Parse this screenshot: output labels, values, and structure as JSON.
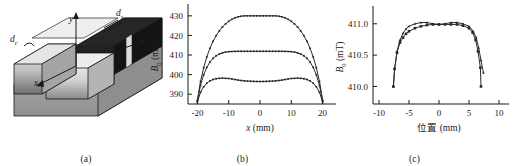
{
  "figure": {
    "panels": [
      {
        "id": "a",
        "caption": "(a)"
      },
      {
        "id": "b",
        "caption": "(b)"
      },
      {
        "id": "c",
        "caption": "(c)"
      }
    ]
  },
  "diagram": {
    "caption": "(a)",
    "labels": {
      "axis_x": "x",
      "axis_y": "y",
      "axis_z": "z",
      "dim_c_base": "d",
      "dim_c_sub": "c",
      "dim_s_base": "d",
      "dim_s_sub": "s"
    },
    "colors": {
      "slab_top": "#e9e9e9",
      "slab_front": "#bdbdbd",
      "slab_side": "#9a9a9a",
      "dark_block": "#2a2a2a",
      "base": "#a8a8a8",
      "outline": "#1a1a1a"
    }
  },
  "chart_data": [
    {
      "panel": "b",
      "type": "line",
      "title": "",
      "xlabel": "x (mm)",
      "ylabel": "B0 (mT)",
      "ylabel_base": "B",
      "ylabel_sub": "0",
      "ylabel_unit": "(mT)",
      "xlim": [
        -23,
        23
      ],
      "ylim": [
        385,
        434
      ],
      "xticks": [
        -20,
        -10,
        0,
        10,
        20
      ],
      "xticklabels": [
        "-20",
        "-10",
        "0",
        "10",
        "20"
      ],
      "yticks": [
        390,
        400,
        410,
        420,
        430
      ],
      "yticklabels": [
        "390",
        "400",
        "410",
        "420",
        "430"
      ],
      "grid": false,
      "legend": "none",
      "markers": "small filled squares along each curve",
      "series": [
        {
          "name": "curve-top",
          "x": [
            -20,
            -19,
            -18,
            -17,
            -16,
            -15,
            -14,
            -13,
            -12,
            -11,
            -10,
            -9,
            -8,
            -7,
            -6,
            -5,
            -4,
            -3,
            -2,
            -1,
            0,
            1,
            2,
            3,
            4,
            5,
            6,
            7,
            8,
            9,
            10,
            11,
            12,
            13,
            14,
            15,
            16,
            17,
            18,
            19,
            20
          ],
          "y": [
            387.0,
            396.5,
            403.5,
            409.0,
            413.4,
            417.0,
            419.9,
            422.3,
            424.3,
            425.9,
            427.2,
            428.2,
            429.0,
            429.5,
            429.8,
            430.0,
            430.0,
            430.0,
            430.0,
            430.0,
            430.0,
            430.0,
            430.0,
            430.0,
            430.0,
            430.0,
            429.8,
            429.5,
            429.0,
            428.2,
            427.2,
            425.9,
            424.3,
            422.3,
            419.9,
            417.0,
            413.4,
            409.0,
            403.5,
            396.5,
            387.0
          ]
        },
        {
          "name": "curve-middle",
          "x": [
            -20,
            -19,
            -18,
            -17,
            -16,
            -15,
            -14,
            -13,
            -12,
            -11,
            -10,
            -9,
            -8,
            -7,
            -6,
            -5,
            -4,
            -3,
            -2,
            -1,
            0,
            1,
            2,
            3,
            4,
            5,
            6,
            7,
            8,
            9,
            10,
            11,
            12,
            13,
            14,
            15,
            16,
            17,
            18,
            19,
            20
          ],
          "y": [
            386.5,
            394.5,
            399.9,
            403.7,
            406.4,
            408.3,
            409.6,
            410.5,
            411.1,
            411.5,
            411.7,
            411.8,
            411.85,
            411.9,
            411.9,
            411.9,
            411.9,
            411.9,
            411.9,
            411.9,
            411.9,
            411.9,
            411.9,
            411.9,
            411.9,
            411.9,
            411.9,
            411.9,
            411.85,
            411.8,
            411.7,
            411.5,
            411.1,
            410.5,
            409.6,
            408.3,
            406.4,
            403.7,
            399.9,
            394.5,
            386.5
          ]
        },
        {
          "name": "curve-bottom",
          "x": [
            -20,
            -19,
            -18,
            -17,
            -16,
            -15,
            -14,
            -13,
            -12,
            -11,
            -10,
            -9,
            -8,
            -7,
            -6,
            -5,
            -4,
            -3,
            -2,
            -1,
            0,
            1,
            2,
            3,
            4,
            5,
            6,
            7,
            8,
            9,
            10,
            11,
            12,
            13,
            14,
            15,
            16,
            17,
            18,
            19,
            20
          ],
          "y": [
            386.0,
            391.0,
            393.8,
            395.6,
            396.8,
            397.5,
            397.9,
            398.1,
            398.2,
            398.1,
            398.0,
            397.8,
            397.5,
            397.2,
            397.0,
            396.8,
            396.7,
            396.6,
            396.55,
            396.5,
            396.5,
            396.5,
            396.55,
            396.6,
            396.7,
            396.8,
            397.0,
            397.2,
            397.5,
            397.8,
            398.0,
            398.1,
            398.2,
            398.1,
            397.9,
            397.5,
            396.8,
            395.6,
            393.8,
            391.0,
            386.0
          ]
        }
      ]
    },
    {
      "panel": "c",
      "type": "line",
      "title": "",
      "xlabel": "位置 (mm)",
      "xlabel_cn": "位置",
      "xlabel_unit": "(mm)",
      "ylabel": "B0 (mT)",
      "ylabel_base": "B",
      "ylabel_sub": "0",
      "ylabel_unit": "(mT)",
      "xlim": [
        -11,
        11
      ],
      "ylim": [
        409.72,
        411.22
      ],
      "xticks": [
        -10,
        -5,
        0,
        5,
        10
      ],
      "xticklabels": [
        "-10",
        "-5",
        "0",
        "5",
        "10"
      ],
      "yticks": [
        410.0,
        410.5,
        411.0
      ],
      "yticklabels": [
        "410.0",
        "410.5",
        "411.0"
      ],
      "grid": false,
      "legend": "none",
      "markers": "filled squares / triangles at each measured point",
      "series": [
        {
          "name": "series-1",
          "marker": "triangle",
          "x": [
            -7.6,
            -7.4,
            -7.0,
            -6.5,
            -6.0,
            -5.5,
            -5.0,
            -4.0,
            -3.0,
            -2.0,
            -1.0,
            0.0,
            1.0,
            2.0,
            3.0,
            4.0,
            5.0,
            5.7,
            6.2,
            6.6,
            7.0,
            7.4
          ],
          "y": [
            410.0,
            410.28,
            410.56,
            410.74,
            410.85,
            410.92,
            410.96,
            411.0,
            411.02,
            411.02,
            411.0,
            410.99,
            411.0,
            411.02,
            411.02,
            411.0,
            410.96,
            410.88,
            410.78,
            410.62,
            410.42,
            410.22
          ]
        },
        {
          "name": "series-2",
          "marker": "square",
          "x": [
            -7.6,
            -7.4,
            -7.0,
            -6.5,
            -6.0,
            -5.5,
            -5.0,
            -4.0,
            -3.0,
            -2.0,
            -1.0,
            0.0,
            1.0,
            2.0,
            3.0,
            4.0,
            5.0,
            5.6,
            6.1,
            6.5,
            6.9,
            7.0
          ],
          "y": [
            410.0,
            410.28,
            410.54,
            410.7,
            410.78,
            410.84,
            410.88,
            410.93,
            410.96,
            410.98,
            410.99,
            410.99,
            410.99,
            410.99,
            410.99,
            410.97,
            410.93,
            410.86,
            410.74,
            410.56,
            410.3,
            410.0
          ]
        }
      ]
    }
  ]
}
